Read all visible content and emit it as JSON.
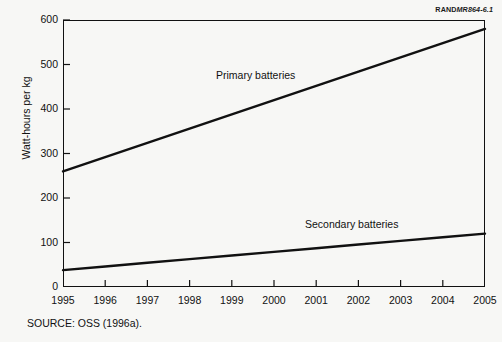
{
  "figure": {
    "rand_brand": "RAND",
    "rand_number": "MR864-6.1",
    "source_note": "SOURCE: OSS (1996a)."
  },
  "chart_data": {
    "type": "line",
    "title": "",
    "xlabel": "",
    "ylabel": "Watt-hours per kg",
    "x": [
      1995,
      1996,
      1997,
      1998,
      1999,
      2000,
      2001,
      2002,
      2003,
      2004,
      2005
    ],
    "xtick_labels": [
      "1995",
      "1996",
      "1997",
      "1998",
      "1999",
      "2000",
      "2001",
      "2002",
      "2003",
      "2004",
      "2005"
    ],
    "ytick_labels": [
      "0",
      "100",
      "200",
      "300",
      "400",
      "500",
      "600"
    ],
    "yticks": [
      0,
      100,
      200,
      300,
      400,
      500,
      600
    ],
    "xlim": [
      1995,
      2005
    ],
    "ylim": [
      0,
      600
    ],
    "grid": false,
    "legend_position": "inline-annotations",
    "series": [
      {
        "name": "Primary batteries",
        "color": "#111111",
        "values": [
          260,
          292,
          324,
          356,
          388,
          420,
          452,
          484,
          516,
          548,
          580
        ]
      },
      {
        "name": "Secondary batteries",
        "color": "#111111",
        "values": [
          38,
          46.2,
          54.4,
          62.6,
          70.8,
          79,
          87.2,
          95.4,
          103.6,
          111.8,
          120
        ]
      }
    ],
    "annotations": [
      {
        "text": "Primary batteries",
        "x": 1999,
        "y": 430
      },
      {
        "text": "Secondary batteries",
        "x": 2001.5,
        "y": 158
      }
    ]
  }
}
